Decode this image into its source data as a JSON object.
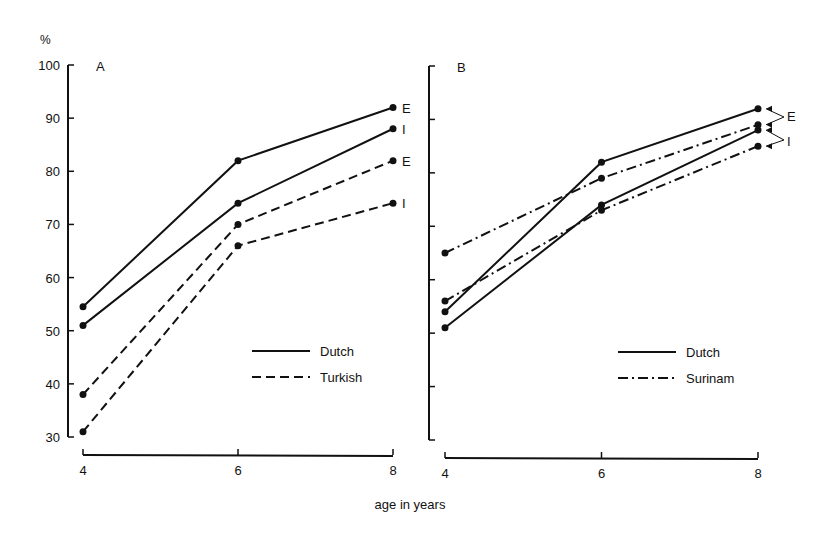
{
  "chart_data": [
    {
      "panel": "A",
      "type": "line",
      "title": "A",
      "ylabel": "%",
      "xlabel": "age in years",
      "x": [
        4,
        6,
        8
      ],
      "yticks": [
        30,
        40,
        50,
        60,
        70,
        80,
        90,
        100
      ],
      "xticks": [
        4,
        6,
        8
      ],
      "ylim": [
        30,
        100
      ],
      "xlim": [
        4,
        8
      ],
      "grid": false,
      "legend": {
        "position": "lower-right",
        "entries": [
          "Dutch",
          "Turkish"
        ]
      },
      "series": [
        {
          "name": "Dutch",
          "condition": "E",
          "style": "solid",
          "values": [
            54.5,
            82,
            92
          ]
        },
        {
          "name": "Dutch",
          "condition": "I",
          "style": "solid",
          "values": [
            51,
            74,
            88
          ]
        },
        {
          "name": "Turkish",
          "condition": "E",
          "style": "dashed",
          "values": [
            38,
            70,
            82
          ]
        },
        {
          "name": "Turkish",
          "condition": "I",
          "style": "dashed",
          "values": [
            31,
            66,
            74
          ]
        }
      ],
      "annotations": [
        "E",
        "I",
        "E",
        "I"
      ]
    },
    {
      "panel": "B",
      "type": "line",
      "title": "B",
      "xlabel": "age in years",
      "x": [
        4,
        6,
        8
      ],
      "xticks": [
        4,
        6,
        8
      ],
      "ylim": [
        30,
        100
      ],
      "xlim": [
        4,
        8
      ],
      "grid": false,
      "legend": {
        "position": "lower-right",
        "entries": [
          "Dutch",
          "Surinam"
        ]
      },
      "series": [
        {
          "name": "Dutch",
          "condition": "E",
          "style": "solid",
          "values": [
            54,
            82,
            92
          ]
        },
        {
          "name": "Dutch",
          "condition": "I",
          "style": "solid",
          "values": [
            51,
            74,
            88
          ]
        },
        {
          "name": "Surinam",
          "condition": "E",
          "style": "dashdot",
          "values": [
            65,
            79,
            89
          ]
        },
        {
          "name": "Surinam",
          "condition": "I",
          "style": "dashdot",
          "values": [
            56,
            73,
            85
          ]
        }
      ],
      "annotations": [
        "E",
        "I"
      ]
    }
  ],
  "labels": {
    "y_unit": "%",
    "panel_a": "A",
    "panel_b": "B",
    "xlabel": "age in years",
    "legend_a": [
      "Dutch",
      "Turkish"
    ],
    "legend_b": [
      "Dutch",
      "Surinam"
    ],
    "annot_E": "E",
    "annot_I": "I"
  }
}
